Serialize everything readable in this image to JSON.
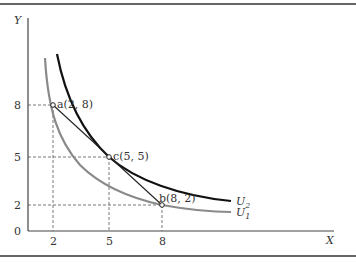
{
  "diagram": {
    "type": "indifference-curves",
    "axes": {
      "x_label": "X",
      "y_label": "Y",
      "origin_label": "0",
      "x_ticks": [
        "2",
        "5",
        "8"
      ],
      "y_ticks": [
        "8",
        "5",
        "2"
      ]
    },
    "points": [
      {
        "id": "a",
        "label": "a(2, 8)",
        "x": 2,
        "y": 8
      },
      {
        "id": "c",
        "label": "c(5, 5)",
        "x": 5,
        "y": 5
      },
      {
        "id": "b",
        "label": "b(8, 2)",
        "x": 8,
        "y": 2
      }
    ],
    "curves": [
      {
        "name": "U2",
        "label_main": "U",
        "label_sub": "2",
        "color": "#111111"
      },
      {
        "name": "U1",
        "label_main": "U",
        "label_sub": "1",
        "color": "#888888"
      }
    ],
    "budget_line": {
      "from": "a",
      "to": "b",
      "color": "#222222"
    }
  }
}
